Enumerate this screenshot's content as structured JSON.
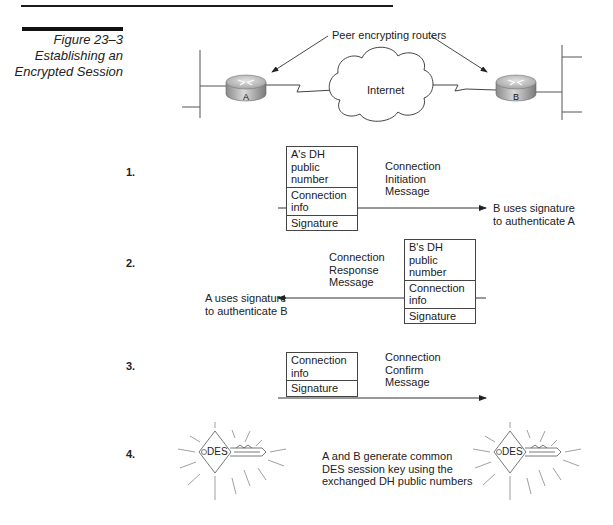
{
  "figure": {
    "number": "Figure 23–3",
    "title_line1": "Establishing an",
    "title_line2": "Encrypted Session"
  },
  "topology": {
    "label": "Peer encrypting routers",
    "router_a": "A",
    "router_b": "B",
    "cloud": "Internet"
  },
  "steps": [
    {
      "number": "1.",
      "fields": [
        "A's DH public number",
        "Connection info",
        "Signature"
      ],
      "message": [
        "Connection",
        "Initiation",
        "Message"
      ],
      "direction": "A to B",
      "note": [
        "B uses signature",
        "to authenticate A"
      ]
    },
    {
      "number": "2.",
      "fields": [
        "B's DH public number",
        "Connection info",
        "Signature"
      ],
      "message": [
        "Connection",
        "Response",
        "Message"
      ],
      "direction": "B to A",
      "note": [
        "A uses signature",
        "to authenticate B"
      ]
    },
    {
      "number": "3.",
      "fields": [
        "Connection info",
        "Signature"
      ],
      "message": [
        "Connection",
        "Confirm",
        "Message"
      ],
      "direction": "A to B"
    },
    {
      "number": "4.",
      "key_label": "DES",
      "description": [
        "A and B generate common",
        "DES session key using the",
        "exchanged DH public numbers"
      ]
    }
  ]
}
